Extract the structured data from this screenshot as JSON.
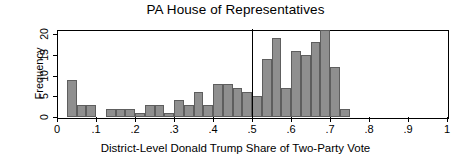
{
  "chart_data": {
    "type": "bar",
    "title": "PA House of Representatives",
    "xlabel": "District-Level Donald Trump Share of Two-Party Vote",
    "ylabel": "Frequency",
    "xlim": [
      0,
      1
    ],
    "ylim": [
      0,
      21
    ],
    "grid": false,
    "legend": null,
    "bin_width": 0.025,
    "xticks": [
      0,
      0.1,
      0.2,
      0.3,
      0.4,
      0.5,
      0.6,
      0.7,
      0.8,
      0.9,
      1
    ],
    "xtick_labels": [
      "0",
      ".1",
      ".2",
      ".3",
      ".4",
      ".5",
      ".6",
      ".7",
      ".8",
      ".9",
      "1"
    ],
    "yticks": [
      0,
      5,
      10,
      15,
      20
    ],
    "ytick_labels": [
      "0",
      "5",
      "10",
      "15",
      "20"
    ],
    "bar_color": "#8f8f8f",
    "bar_edge_color": "#5e5e5e",
    "frame_color": "#000000",
    "background_color": "#ffffff",
    "annotations": [
      {
        "name": "reference-line",
        "type": "vline",
        "x": 0.5,
        "color": "#000000"
      }
    ],
    "bin_starts": [
      0.025,
      0.05,
      0.075,
      0.125,
      0.15,
      0.175,
      0.2,
      0.225,
      0.25,
      0.275,
      0.3,
      0.325,
      0.35,
      0.375,
      0.4,
      0.425,
      0.45,
      0.475,
      0.5,
      0.525,
      0.55,
      0.575,
      0.6,
      0.625,
      0.65,
      0.675,
      0.7,
      0.725
    ],
    "categories": [
      "0.025",
      "0.050",
      "0.075",
      "0.125",
      "0.150",
      "0.175",
      "0.200",
      "0.225",
      "0.250",
      "0.275",
      "0.300",
      "0.325",
      "0.350",
      "0.375",
      "0.400",
      "0.425",
      "0.450",
      "0.475",
      "0.500",
      "0.525",
      "0.550",
      "0.575",
      "0.600",
      "0.625",
      "0.650",
      "0.675",
      "0.700",
      "0.725"
    ],
    "values": [
      9,
      3,
      3,
      2,
      2,
      2,
      1,
      3,
      3,
      1,
      4,
      3,
      6,
      3,
      8,
      8,
      7,
      6,
      5,
      14,
      19,
      7,
      16,
      15,
      18,
      21,
      12,
      2
    ]
  }
}
